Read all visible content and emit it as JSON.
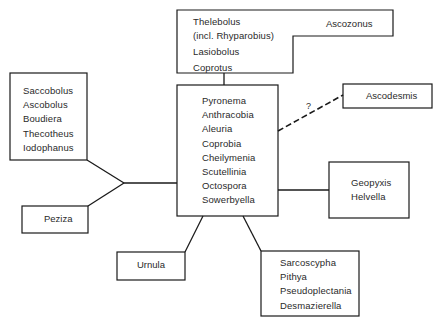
{
  "diagram": {
    "type": "relationship-diagram",
    "nodes": {
      "top_group": {
        "left_items": [
          "Thelebolus",
          "(incl. Rhyparobius)",
          "Lasiobolus",
          "Coprotus"
        ],
        "right_item": "Ascozonus"
      },
      "center_group": {
        "items": [
          "Pyronema",
          "Anthracobia",
          "Aleuria",
          "Coprobia",
          "Cheilymenia",
          "Scutellinia",
          "Octospora",
          "Sowerbyella"
        ]
      },
      "left_upper_group": {
        "items": [
          "Saccobolus",
          "Ascobolus",
          "Boudiera",
          "Thecotheus",
          "Iodophanus"
        ]
      },
      "peziza": {
        "label": "Peziza"
      },
      "urnula": {
        "label": "Urnula"
      },
      "bottom_right_group": {
        "items": [
          "Sarcoscypha",
          "Pithya",
          "Pseudoplectania",
          "Desmazierella"
        ]
      },
      "right_group": {
        "items": [
          "Geopyxis",
          "Helvella"
        ]
      },
      "ascodesmis": {
        "label": "Ascodesmis"
      }
    },
    "edges": [
      {
        "from": "center_group",
        "to": "top_group",
        "style": "solid"
      },
      {
        "from": "center_group",
        "to": "left_upper_group",
        "style": "solid",
        "via": "left-junction"
      },
      {
        "from": "center_group",
        "to": "peziza",
        "style": "solid",
        "via": "left-junction"
      },
      {
        "from": "center_group",
        "to": "urnula",
        "style": "solid"
      },
      {
        "from": "center_group",
        "to": "bottom_right_group",
        "style": "solid"
      },
      {
        "from": "center_group",
        "to": "right_group",
        "style": "solid"
      },
      {
        "from": "center_group",
        "to": "ascodesmis",
        "style": "dashed",
        "label": "?"
      }
    ],
    "line_color": "#1a1a1a"
  }
}
